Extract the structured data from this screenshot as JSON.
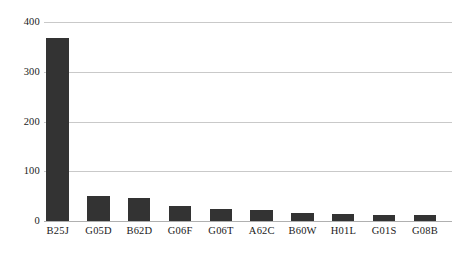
{
  "chart_data": {
    "type": "bar",
    "title": "",
    "subtitle": "",
    "xlabel": "",
    "ylabel": "",
    "categories": [
      "B25J",
      "G05D",
      "B62D",
      "G06F",
      "G06T",
      "A62C",
      "B60W",
      "H01L",
      "G01S",
      "G08B"
    ],
    "values": [
      368,
      50,
      46,
      30,
      24,
      22,
      17,
      15,
      13,
      13
    ],
    "ylim": [
      0,
      400
    ],
    "yticks": [
      0,
      100,
      200,
      300,
      400
    ],
    "ytick_labels": [
      "0",
      "100",
      "200",
      "300",
      "400"
    ],
    "grid": true,
    "grid_axis": "y",
    "legend": false,
    "legend_position": "none",
    "bar_color": "#333333",
    "grid_color": "#c9c9c9",
    "axis_color": "#b0b0b0",
    "background_color": "#ffffff",
    "text_color": "#1a1a1a",
    "bar_width_ratio": 0.55,
    "series": [
      {
        "name": "count",
        "values": [
          368,
          50,
          46,
          30,
          24,
          22,
          17,
          15,
          13,
          13
        ]
      }
    ]
  }
}
